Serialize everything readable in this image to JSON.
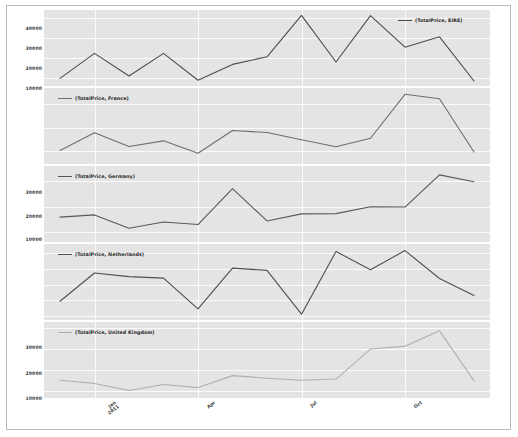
{
  "figure": {
    "width": 518,
    "height": 437,
    "background_color": "#ffffff",
    "panel_background_color": "#e4e4e4",
    "grid_color": "#fbfbfb",
    "border_color": "#b9b9b9"
  },
  "xaxis": {
    "tick_labels": [
      "Jan\n2011",
      "Apr",
      "Jul",
      "Oct"
    ],
    "tick_positions_index": [
      1,
      4,
      7,
      10
    ],
    "label": ""
  },
  "chart_data": {
    "type": "line",
    "title": "",
    "xlabel": "",
    "ylabel": "",
    "grid": true,
    "legend_position": "inside",
    "x": [
      "Dec 2010",
      "Jan 2011",
      "Feb 2011",
      "Mar 2011",
      "Apr 2011",
      "May 2011",
      "Jun 2011",
      "Jul 2011",
      "Aug 2011",
      "Sep 2011",
      "Oct 2011",
      "Nov 2011",
      "Dec 2011"
    ],
    "panels": [
      {
        "name": "eire-panel",
        "legend_label": "(TotalPrice, EIRE)",
        "series_name": "EIRE",
        "color": "#4d4d4d",
        "ylim": [
          6000,
          44000
        ],
        "yticks": [
          10000,
          20000,
          30000,
          40000
        ],
        "ytick_labels": [
          "10000",
          "20000",
          "30000",
          "40000"
        ],
        "values": [
          9800,
          22300,
          11000,
          22300,
          8900,
          16800,
          20600,
          41300,
          18000,
          41200,
          25400,
          30600,
          8500
        ]
      },
      {
        "name": "france-panel",
        "legend_label": "(TotalPrice, France)",
        "series_name": "France",
        "color": "#6e6e6e",
        "ylim": [
          4500,
          37000
        ],
        "yticks": [
          10000,
          20000,
          30000
        ],
        "ytick_labels": [
          "10000",
          "20000",
          "30000"
        ],
        "values": [
          10300,
          17900,
          12000,
          14400,
          9100,
          18800,
          18000,
          14900,
          11900,
          15500,
          34300,
          32400,
          9600
        ]
      },
      {
        "name": "germany-panel",
        "legend_label": "(TotalPrice, Germany)",
        "series_name": "Germany",
        "color": "#595959",
        "ylim": [
          6000,
          36000
        ],
        "yticks": [
          10000,
          20000,
          30000
        ],
        "ytick_labels": [
          "10000",
          "20000",
          "30000"
        ],
        "values": [
          15800,
          16700,
          11400,
          13900,
          12900,
          27100,
          14300,
          17100,
          17200,
          19900,
          19800,
          32500,
          29800
        ]
      },
      {
        "name": "netherlands-panel",
        "legend_label": "(TotalPrice, Netherlands)",
        "series_name": "Netherlands",
        "color": "#4f4f4f",
        "ylim": [
          -2500,
          46000
        ],
        "yticks": [
          0,
          10000,
          20000,
          30000,
          40000
        ],
        "ytick_labels": [
          "0",
          "10000",
          "20000",
          "30000",
          "40000"
        ],
        "values": [
          9500,
          27500,
          25200,
          24200,
          4600,
          30600,
          29200,
          1200,
          41200,
          29600,
          41800,
          24000,
          13200
        ]
      },
      {
        "name": "united-kingdom-panel",
        "legend_label": "(TotalPrice, United Kingdom)",
        "series_name": "United Kingdom",
        "color": "#b0b0b0",
        "ylim": [
          330000,
          1060000
        ],
        "yticks": [
          400000,
          600000,
          800000,
          1000000
        ],
        "ytick_labels": [
          "400000",
          "600000",
          "800000",
          "1000000"
        ],
        "values": [
          500000,
          470000,
          402000,
          460000,
          430000,
          545000,
          520000,
          500000,
          512000,
          800000,
          828000,
          975000,
          495000
        ]
      }
    ]
  }
}
